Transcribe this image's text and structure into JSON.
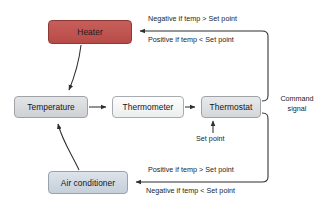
{
  "diagram": {
    "nodes": [
      {
        "id": "heater",
        "label": "Heater",
        "fill": "#bf5450",
        "border": "#8d3a36"
      },
      {
        "id": "temperature",
        "label": "Temperature",
        "fill": "#d6d8db",
        "border": "#9fa3a8"
      },
      {
        "id": "thermometer",
        "label": "Thermometer",
        "fill": "#f3f4f5",
        "border": "#a8abaf"
      },
      {
        "id": "thermostat",
        "label": "Thermostat",
        "fill": "#dcdee1",
        "border": "#9fa3a8"
      },
      {
        "id": "airconditioner",
        "label": "Air conditioner",
        "fill": "#ced7e0",
        "border": "#97a2ad"
      }
    ],
    "edge_labels": {
      "top_negative": "Negative if temp > Set point",
      "top_positive": "Positive if temp < Set point",
      "bottom_positive": "Positive if temp > Set point",
      "bottom_negative": "Negative if temp < Set point",
      "set_point": "Set point",
      "command_signal_line1": "Command",
      "command_signal_line2": "signal"
    },
    "line_color": "#3b3b3b",
    "background": "#ffffff"
  }
}
